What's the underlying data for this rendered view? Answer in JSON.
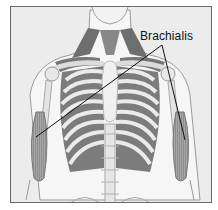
{
  "figure": {
    "label": "Brachialis",
    "label_target_count": 2,
    "colors": {
      "background": "#ececec",
      "bone": "#f4f4f4",
      "bone_outline": "#9a9a9a",
      "muscle": "#8a8a8a",
      "rib_muscle": "#7a7a7a",
      "leader_line": "#111111",
      "border": "#6a6a6a"
    }
  }
}
